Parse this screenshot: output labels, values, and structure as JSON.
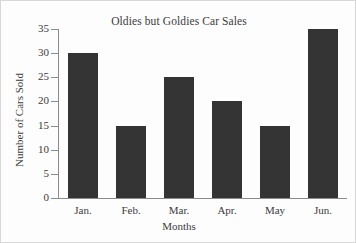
{
  "chart_data": {
    "type": "bar",
    "title": "Oldies but Goldies Car Sales",
    "xlabel": "Months",
    "ylabel": "Number of Cars Sold",
    "categories": [
      "Jan.",
      "Feb.",
      "Mar.",
      "Apr.",
      "May",
      "Jun."
    ],
    "values": [
      30,
      15,
      25,
      20,
      15,
      35
    ],
    "ylim": [
      0,
      35
    ],
    "ytick_labels": [
      "0",
      "5",
      "10",
      "15",
      "20",
      "25",
      "30",
      "35"
    ],
    "ytick_values": [
      0,
      5,
      10,
      15,
      20,
      25,
      30,
      35
    ],
    "grid": false,
    "legend": null,
    "series": [
      {
        "name": "Cars Sold",
        "values": [
          30,
          15,
          25,
          20,
          15,
          35
        ]
      }
    ]
  },
  "colors": {
    "bar": "#343434",
    "axis": "#8b8b8b",
    "text": "#3b3b3b",
    "background": "#fdfdfd",
    "frame": "#d8d8d8"
  }
}
